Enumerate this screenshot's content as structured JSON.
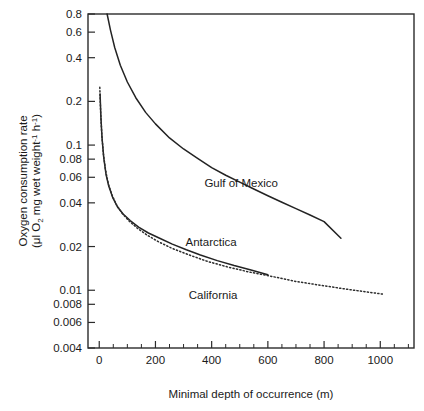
{
  "chart_data": {
    "type": "line",
    "title": "",
    "xlabel": "Minimal depth of occurrence (m)",
    "ylabel_line1": "Oxygen consumption rate",
    "ylabel_line2": "(μl O₂ mg wet weight⁻¹ h⁻¹)",
    "yscale": "log",
    "xscale": "linear",
    "xlim": [
      -40,
      1120
    ],
    "ylim": [
      0.004,
      0.8
    ],
    "grid": false,
    "legend_position": "inline-annotations",
    "xticks": [
      0,
      200,
      400,
      600,
      800,
      1000
    ],
    "xticklabels": [
      "0",
      "200",
      "400",
      "600",
      "800",
      "1000"
    ],
    "xminorticks": [
      50,
      100,
      150,
      250,
      300,
      350,
      450,
      500,
      550,
      650,
      700,
      750,
      850,
      900,
      950,
      1050,
      1100
    ],
    "yticks": [
      0.004,
      0.006,
      0.008,
      0.01,
      0.02,
      0.04,
      0.06,
      0.08,
      0.1,
      0.2,
      0.4,
      0.6,
      0.8
    ],
    "yticklabels": [
      "0.004",
      "0.006",
      "0.008",
      "0.01",
      "0.02",
      "0.04",
      "0.06",
      "0.08",
      "0.1",
      "0.2",
      "0.4",
      "0.6",
      "0.8"
    ],
    "line_color": "#232323",
    "series": [
      {
        "name": "Gulf of Mexico",
        "style": "solid",
        "label_x": 505,
        "label_y": 0.055,
        "x": [
          28,
          40,
          55,
          75,
          100,
          130,
          165,
          200,
          250,
          300,
          350,
          400,
          450,
          500,
          550,
          600,
          650,
          700,
          750,
          800,
          860
        ],
        "y": [
          0.8,
          0.62,
          0.47,
          0.355,
          0.272,
          0.212,
          0.168,
          0.14,
          0.112,
          0.094,
          0.081,
          0.07,
          0.062,
          0.0555,
          0.0498,
          0.0448,
          0.0404,
          0.0365,
          0.033,
          0.0297,
          0.0228
        ]
      },
      {
        "name": "Antarctica",
        "style": "solid",
        "label_x": 398,
        "label_y": 0.0215,
        "x": [
          3,
          6,
          10,
          16,
          24,
          34,
          48,
          65,
          85,
          110,
          140,
          175,
          215,
          260,
          310,
          360,
          420,
          480,
          540,
          600
        ],
        "y": [
          0.225,
          0.155,
          0.112,
          0.082,
          0.063,
          0.052,
          0.0435,
          0.0375,
          0.0335,
          0.0302,
          0.0272,
          0.0248,
          0.0228,
          0.0208,
          0.019,
          0.0175,
          0.016,
          0.0148,
          0.0138,
          0.0128
        ]
      },
      {
        "name": "California",
        "style": "dotted",
        "label_x": 405,
        "label_y": 0.0092,
        "x": [
          2,
          5,
          9,
          15,
          23,
          33,
          46,
          62,
          82,
          106,
          135,
          170,
          210,
          260,
          320,
          385,
          455,
          530,
          610,
          700,
          790,
          890,
          1010
        ],
        "y": [
          0.25,
          0.168,
          0.118,
          0.086,
          0.066,
          0.0535,
          0.045,
          0.0385,
          0.0338,
          0.03,
          0.0268,
          0.024,
          0.0216,
          0.0194,
          0.0175,
          0.0158,
          0.0145,
          0.0134,
          0.0125,
          0.0115,
          0.0108,
          0.0101,
          0.0094
        ]
      }
    ]
  },
  "plot_box": {
    "left_px": 88,
    "right_px": 414,
    "top_px": 14,
    "bottom_px": 348
  }
}
